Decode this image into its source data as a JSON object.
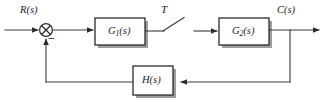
{
  "diagram": {
    "type": "block-diagram",
    "background_color": "#ffffff",
    "line_color": "#3a3a3a",
    "block_fill": "#ffffff",
    "block_border_color": "#2b2b2b",
    "shadow_color": "#9a9a9a",
    "signals": {
      "input": "R(s)",
      "output": "C(s)",
      "feedback_sign": "−",
      "sampling_period": "T"
    },
    "blocks": [
      {
        "id": "G1",
        "label_main": "G",
        "label_sub": "1",
        "label_arg": "(s)",
        "label_full": "G₁(s)",
        "x": 95,
        "y": 18,
        "w": 50,
        "h": 27
      },
      {
        "id": "G2",
        "label_main": "G",
        "label_sub": "2",
        "label_arg": "(s)",
        "label_full": "G₂(s)",
        "x": 219,
        "y": 18,
        "w": 50,
        "h": 27
      },
      {
        "id": "H",
        "label_main": "H",
        "label_sub": "",
        "label_arg": "(s)",
        "label_full": "H(s)",
        "x": 133,
        "y": 66,
        "w": 40,
        "h": 29
      }
    ],
    "summing_junction": {
      "id": "sum",
      "shape": "circle-with-cross",
      "cx": 46,
      "cy": 30,
      "r": 6.5,
      "inputs": [
        "R(s)",
        "feedback"
      ],
      "sign_label": "−"
    },
    "sampler": {
      "id": "sampler-switch",
      "label": "T",
      "description": "ideal sampler / switch between G1(s) and G2(s)",
      "pivot_x": 163,
      "pivot_y": 31,
      "blade_tip_x": 183,
      "blade_tip_y": 18
    },
    "labels": {
      "input_label": "R(s)",
      "output_label": "C(s)",
      "period_label": "T",
      "minus_label": "−"
    },
    "connections": [
      {
        "from": "input",
        "to": "sum",
        "kind": "arrow"
      },
      {
        "from": "sum",
        "to": "G1",
        "kind": "arrow"
      },
      {
        "from": "G1",
        "to": "sampler",
        "kind": "line"
      },
      {
        "from": "sampler",
        "to": "G2",
        "kind": "arrow"
      },
      {
        "from": "G2",
        "to": "output",
        "kind": "arrow"
      },
      {
        "from": "output-tap",
        "to": "H",
        "kind": "arrow"
      },
      {
        "from": "H",
        "to": "sum",
        "kind": "arrow"
      }
    ]
  }
}
